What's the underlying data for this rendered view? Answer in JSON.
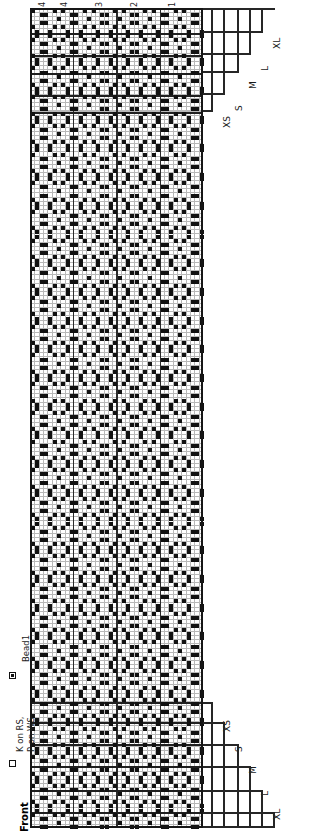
{
  "chart_data": {
    "type": "table",
    "grid": {
      "columns": 40,
      "rows": 200,
      "cell_width_px": 4.325,
      "cell_height_px": 4.1,
      "heavy_line_every_columns": 10,
      "grid_color": "#b8b8b8",
      "heavy_line_color": "#2b2b2b",
      "border_color": "#161616"
    },
    "column_numbers": [
      "4",
      "4",
      "3",
      "2",
      "1"
    ],
    "section_lines_top_px": [
      8,
      33,
      55,
      73,
      95,
      112
    ],
    "section_lines_bottom_px": [
      702,
      722,
      744,
      766,
      790,
      812
    ],
    "bead_symbol": "square-with-dot",
    "bead_density": "diagonal repeating lattice, approximately every 3rd-4th stitch offset by row"
  },
  "legend": {
    "title": "Front",
    "entries": [
      {
        "symbol": "empty-square",
        "label": "K on RS,\nP on WS",
        "line1": "K on RS,",
        "line2": "P on WS"
      },
      {
        "symbol": "square-with-dot",
        "label": "Bead1"
      }
    ]
  },
  "top_axis": {
    "numbers": [
      {
        "text": "4",
        "x": 33
      },
      {
        "text": "4",
        "x": 55
      },
      {
        "text": "3",
        "x": 90
      },
      {
        "text": "2",
        "x": 125
      },
      {
        "text": "1",
        "x": 163
      }
    ]
  },
  "size_brackets_top": [
    {
      "label": "XS"
    },
    {
      "label": "S"
    },
    {
      "label": "M"
    },
    {
      "label": "L"
    },
    {
      "label": "XL"
    },
    {
      "label": "XXL"
    }
  ],
  "size_brackets_bottom": [
    {
      "label": "XS"
    },
    {
      "label": "S"
    },
    {
      "label": "M"
    },
    {
      "label": "L"
    },
    {
      "label": "XL"
    },
    {
      "label": "XXL"
    }
  ],
  "colors": {
    "background": "#ffffff",
    "grid_light": "#b8b8b8",
    "grid_heavy": "#2b2b2b",
    "ink": "#111111"
  }
}
